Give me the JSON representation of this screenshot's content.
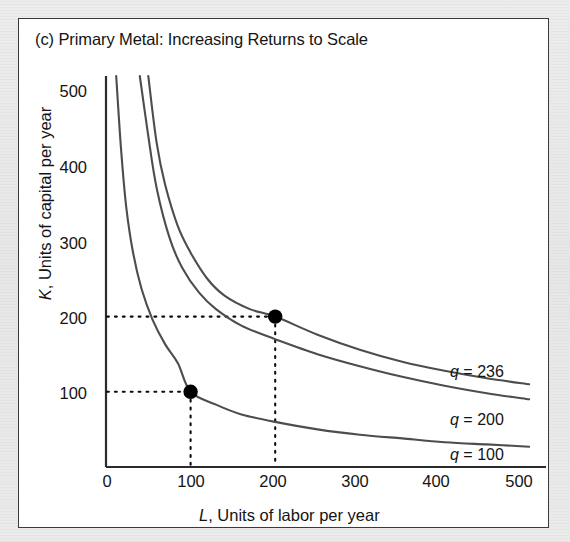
{
  "panel": {
    "title": "(c) Primary Metal: Increasing Returns to Scale",
    "background_color": "#ffffff",
    "border_color": "#3a3a3a",
    "outer_background_color": "#e8e8e8"
  },
  "chart_data": {
    "type": "line",
    "title": "(c) Primary Metal: Increasing Returns to Scale",
    "xlabel": "L, Units of labor per year",
    "ylabel": "K, Units of capital per year",
    "xlim": [
      0,
      520
    ],
    "ylim": [
      0,
      520
    ],
    "xticks": [
      0,
      100,
      200,
      300,
      400,
      500
    ],
    "xtick_labels": [
      "0",
      "100",
      "200",
      "300",
      "400",
      "500"
    ],
    "yticks": [
      100,
      200,
      300,
      400,
      500
    ],
    "ytick_labels": [
      "100",
      "200",
      "300",
      "400",
      "500"
    ],
    "grid": false,
    "legend_position": "inline-right",
    "curve_color": "#4d4d4d",
    "marker_color": "#000000",
    "series": [
      {
        "name": "q = 236",
        "label": "q = 236",
        "q": 236,
        "curve_type": "isoquant",
        "points": [
          {
            "x": 50,
            "y": 520
          },
          {
            "x": 60,
            "y": 430
          },
          {
            "x": 70,
            "y": 375
          },
          {
            "x": 85,
            "y": 320
          },
          {
            "x": 100,
            "y": 285
          },
          {
            "x": 120,
            "y": 250
          },
          {
            "x": 140,
            "y": 228
          },
          {
            "x": 170,
            "y": 210
          },
          {
            "x": 200,
            "y": 200
          },
          {
            "x": 250,
            "y": 176
          },
          {
            "x": 300,
            "y": 156
          },
          {
            "x": 350,
            "y": 140
          },
          {
            "x": 400,
            "y": 128
          },
          {
            "x": 450,
            "y": 118
          },
          {
            "x": 500,
            "y": 110
          }
        ]
      },
      {
        "name": "q = 200",
        "label": "q = 200",
        "q": 200,
        "curve_type": "isoquant",
        "points": [
          {
            "x": 40,
            "y": 520
          },
          {
            "x": 50,
            "y": 440
          },
          {
            "x": 60,
            "y": 370
          },
          {
            "x": 75,
            "y": 305
          },
          {
            "x": 90,
            "y": 265
          },
          {
            "x": 110,
            "y": 232
          },
          {
            "x": 130,
            "y": 210
          },
          {
            "x": 160,
            "y": 188
          },
          {
            "x": 200,
            "y": 170
          },
          {
            "x": 250,
            "y": 150
          },
          {
            "x": 300,
            "y": 134
          },
          {
            "x": 350,
            "y": 120
          },
          {
            "x": 400,
            "y": 108
          },
          {
            "x": 450,
            "y": 98
          },
          {
            "x": 500,
            "y": 90
          }
        ]
      },
      {
        "name": "q = 100",
        "label": "q = 100",
        "q": 100,
        "curve_type": "isoquant",
        "points": [
          {
            "x": 12,
            "y": 520
          },
          {
            "x": 18,
            "y": 420
          },
          {
            "x": 24,
            "y": 345
          },
          {
            "x": 32,
            "y": 285
          },
          {
            "x": 42,
            "y": 237
          },
          {
            "x": 55,
            "y": 196
          },
          {
            "x": 70,
            "y": 163
          },
          {
            "x": 85,
            "y": 138
          },
          {
            "x": 100,
            "y": 100
          },
          {
            "x": 130,
            "y": 83
          },
          {
            "x": 160,
            "y": 70
          },
          {
            "x": 200,
            "y": 60
          },
          {
            "x": 250,
            "y": 50
          },
          {
            "x": 300,
            "y": 43
          },
          {
            "x": 350,
            "y": 38
          },
          {
            "x": 400,
            "y": 33
          },
          {
            "x": 450,
            "y": 30
          },
          {
            "x": 500,
            "y": 27
          }
        ]
      }
    ],
    "markers": [
      {
        "label": "point-low",
        "x": 100,
        "y": 100,
        "on_curve": "q = 100"
      },
      {
        "label": "point-high",
        "x": 200,
        "y": 200,
        "on_curve": "q = 236"
      }
    ],
    "guide_lines": [
      {
        "name": "guide-K-100",
        "orientation": "horizontal",
        "value": 100,
        "from": 0,
        "to": 100
      },
      {
        "name": "guide-L-100",
        "orientation": "vertical",
        "value": 100,
        "from": 0,
        "to": 100
      },
      {
        "name": "guide-K-200",
        "orientation": "horizontal",
        "value": 200,
        "from": 0,
        "to": 200
      },
      {
        "name": "guide-L-200",
        "orientation": "vertical",
        "value": 200,
        "from": 0,
        "to": 200
      }
    ]
  }
}
